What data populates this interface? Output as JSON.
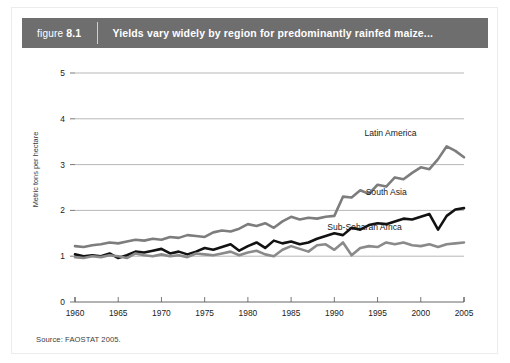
{
  "header": {
    "figure_word": "figure",
    "figure_number": "8.1",
    "title": "Yields vary widely by region for predominantly rainfed maize...",
    "band_color": "#6e6e6e",
    "text_color": "#ffffff"
  },
  "source": {
    "text": "Source: FAOSTAT 2005."
  },
  "chart_data": {
    "type": "line",
    "title": "Yields vary widely by region for predominantly rainfed maize...",
    "xlabel": "",
    "ylabel": "Metric tons per hectare",
    "xlim": [
      1960,
      2005
    ],
    "ylim": [
      0,
      5
    ],
    "xticks": [
      1960,
      1965,
      1970,
      1975,
      1980,
      1985,
      1990,
      1995,
      2000,
      2005
    ],
    "yticks": [
      0,
      1,
      2,
      3,
      4,
      5
    ],
    "xtick_labels": [
      "1960",
      "1965",
      "1970",
      "1975",
      "1980",
      "1985",
      "1990",
      "1995",
      "2000",
      "2005"
    ],
    "ytick_labels": [
      "0",
      "1",
      "2",
      "3",
      "4",
      "5"
    ],
    "grid": "horizontal",
    "legend_position": "inline-labels",
    "x": [
      1960,
      1961,
      1962,
      1963,
      1964,
      1965,
      1966,
      1967,
      1968,
      1969,
      1970,
      1971,
      1972,
      1973,
      1974,
      1975,
      1976,
      1977,
      1978,
      1979,
      1980,
      1981,
      1982,
      1983,
      1984,
      1985,
      1986,
      1987,
      1988,
      1989,
      1990,
      1991,
      1992,
      1993,
      1994,
      1995,
      1996,
      1997,
      1998,
      1999,
      2000,
      2001,
      2002,
      2003,
      2004,
      2005
    ],
    "series": [
      {
        "name": "Latin America",
        "color": "#7d7d7d",
        "label_x": 1996.5,
        "label_y": 3.62,
        "values": [
          1.22,
          1.2,
          1.24,
          1.26,
          1.3,
          1.28,
          1.32,
          1.36,
          1.34,
          1.38,
          1.36,
          1.42,
          1.4,
          1.46,
          1.44,
          1.42,
          1.52,
          1.56,
          1.54,
          1.6,
          1.7,
          1.66,
          1.72,
          1.62,
          1.76,
          1.86,
          1.8,
          1.84,
          1.82,
          1.86,
          1.88,
          2.3,
          2.28,
          2.44,
          2.36,
          2.56,
          2.52,
          2.72,
          2.68,
          2.82,
          2.94,
          2.9,
          3.12,
          3.4,
          3.3,
          3.16
        ]
      },
      {
        "name": "South Asia",
        "color": "#121212",
        "label_x": 1996.0,
        "label_y": 2.34,
        "values": [
          1.04,
          1.0,
          1.02,
          1.0,
          1.06,
          0.96,
          1.02,
          1.1,
          1.08,
          1.12,
          1.16,
          1.06,
          1.1,
          1.04,
          1.1,
          1.18,
          1.14,
          1.2,
          1.26,
          1.12,
          1.22,
          1.3,
          1.18,
          1.34,
          1.28,
          1.32,
          1.26,
          1.3,
          1.38,
          1.44,
          1.5,
          1.46,
          1.62,
          1.58,
          1.68,
          1.72,
          1.7,
          1.76,
          1.82,
          1.8,
          1.86,
          1.92,
          1.58,
          1.88,
          2.02,
          2.05
        ]
      },
      {
        "name": "Sub-Saharan Africa",
        "color": "#8a8a8a",
        "label_x": 1993.5,
        "label_y": 1.58,
        "values": [
          0.98,
          0.96,
          1.0,
          0.98,
          1.02,
          1.0,
          0.96,
          1.06,
          1.02,
          1.0,
          1.04,
          1.0,
          1.02,
          0.98,
          1.06,
          1.04,
          1.02,
          1.06,
          1.1,
          1.02,
          1.08,
          1.12,
          1.04,
          1.0,
          1.14,
          1.22,
          1.16,
          1.1,
          1.24,
          1.26,
          1.14,
          1.3,
          1.02,
          1.18,
          1.22,
          1.2,
          1.3,
          1.26,
          1.3,
          1.24,
          1.22,
          1.26,
          1.2,
          1.26,
          1.28,
          1.3
        ]
      }
    ]
  }
}
